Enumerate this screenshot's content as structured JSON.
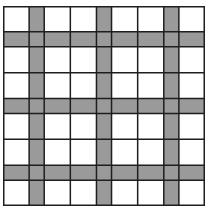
{
  "diagram": {
    "title": "",
    "type": "grid",
    "column_bands": [
      "white",
      "gray",
      "white",
      "white",
      "gray",
      "white",
      "white",
      "gray",
      "white"
    ],
    "row_bands": [
      "white",
      "gray",
      "white",
      "white",
      "gray",
      "white",
      "white",
      "gray",
      "white"
    ],
    "colors": {
      "white": "#ffffff",
      "gray": "#9a9a9a",
      "line": "#1e1e1e"
    }
  }
}
